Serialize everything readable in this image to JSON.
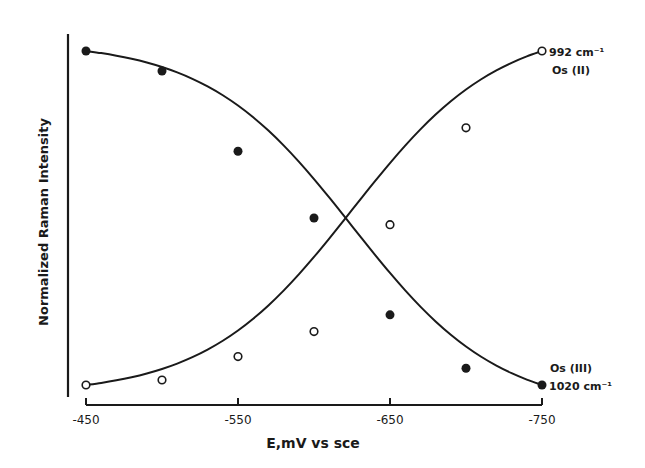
{
  "chart_data": {
    "type": "line",
    "title": "",
    "xlabel": "E,mV vs sce",
    "ylabel": "Normalized Raman Intensity",
    "x": [
      -450,
      -500,
      -550,
      -600,
      -650,
      -700,
      -750
    ],
    "xticks": [
      -450,
      -550,
      -650,
      -750
    ],
    "xtick_labels": [
      "-450",
      "-550",
      "-650",
      "-750"
    ],
    "xlim": [
      -450,
      -750
    ],
    "ylim": [
      0,
      1
    ],
    "yticks": [],
    "grid": false,
    "legend": "inline annotations at curve ends",
    "series": [
      {
        "name": "1020 cm-1 Os (III)",
        "marker": "filled-circle",
        "values": [
          1.0,
          0.94,
          0.7,
          0.5,
          0.21,
          0.05,
          0.0
        ]
      },
      {
        "name": "992 cm-1 Os (II)",
        "marker": "open-circle",
        "values": [
          0.0,
          0.015,
          0.085,
          0.16,
          0.48,
          0.77,
          1.0
        ]
      }
    ],
    "annotations": [
      {
        "text": "992 cm⁻¹",
        "near": "open series end (-750, 1.0)"
      },
      {
        "text": "Os (II)",
        "near": "open series end (-750, 1.0)"
      },
      {
        "text": "Os (III)",
        "near": "filled series end (-750, 0.0)"
      },
      {
        "text": "1020 cm⁻¹",
        "near": "filled series end (-750, 0.0)"
      }
    ]
  },
  "labels": {
    "x_axis": "E,mV vs sce",
    "y_axis": "Normalized Raman Intensity",
    "ticks": [
      "-450",
      "-550",
      "-650",
      "-750"
    ],
    "ann_992": "992 cm⁻¹",
    "ann_os2": "Os (II)",
    "ann_os3": "Os (III)",
    "ann_1020": "1020 cm⁻¹"
  },
  "style": {
    "ink": "#1a1a1a",
    "background": "#ffffff"
  }
}
